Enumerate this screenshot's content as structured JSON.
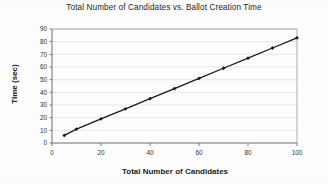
{
  "figure": {
    "background_color": "#fdfdfd",
    "ink_color": "#1a1a1a",
    "gridline_color": "#d8d8d8"
  },
  "chart_data": {
    "type": "line",
    "title": "Total Number of Candidates vs. Ballot Creation Time",
    "xlabel": "Total Number of Candidates",
    "ylabel": "Time (sec)",
    "xlim": [
      0,
      100
    ],
    "ylim": [
      0,
      90
    ],
    "xticks": [
      0,
      20,
      40,
      60,
      80,
      100
    ],
    "yticks": [
      0,
      10,
      20,
      30,
      40,
      50,
      60,
      70,
      80,
      90
    ],
    "grid": "horizontal",
    "legend": "none",
    "marker": "diamond",
    "series": [
      {
        "name": "Ballot creation time",
        "x": [
          5,
          10,
          20,
          30,
          40,
          50,
          60,
          70,
          80,
          90,
          100
        ],
        "y": [
          6,
          11,
          19,
          27,
          35,
          43,
          51,
          59,
          67,
          75,
          83
        ]
      }
    ]
  }
}
